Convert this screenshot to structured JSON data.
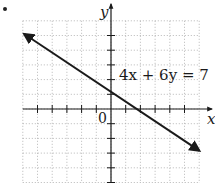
{
  "figure": {
    "bullet": true,
    "equation_label": "4x + 6y = 7",
    "x_axis_label": "x",
    "y_axis_label": "y",
    "origin_label": "0"
  },
  "chart_data": {
    "type": "line",
    "title": "",
    "xlabel": "x",
    "ylabel": "y",
    "equation": "4x + 6y = 7",
    "slope": -0.6667,
    "y_intercept": 1.1667,
    "x_intercept": 1.75,
    "x": [
      -5.9,
      0,
      1.75,
      6
    ],
    "y": [
      5.1,
      1.1667,
      0,
      -2.8333
    ],
    "xlim": [
      -6,
      6
    ],
    "ylim": [
      -5,
      6
    ],
    "grid": true,
    "grid_style": "dotted",
    "tick_spacing": 1,
    "arrows_on_line_ends": true,
    "legend": null
  },
  "style": {
    "line_color": "#1a1a1a",
    "axis_color": "#1a1a1a",
    "grid_color": "#9a9a9a",
    "background": "#ffffff"
  }
}
